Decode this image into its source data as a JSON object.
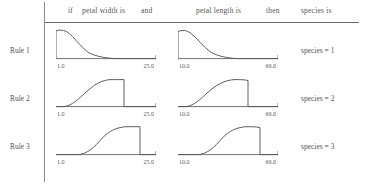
{
  "header": {
    "if_label": "if",
    "antecedent1_label": "petal width is",
    "and_label": "and",
    "antecedent2_label": "petal length is",
    "then_label": "then",
    "consequent_label": "species is"
  },
  "axes": {
    "petal_width": {
      "min_label": "1.0",
      "max_label": "25.0"
    },
    "petal_length": {
      "min_label": "10.0",
      "max_label": "69.0"
    }
  },
  "colors": {
    "curve": "#555555",
    "axis": "#6b6b6b",
    "text": "#555555",
    "background": "#ffffff"
  },
  "rules": [
    {
      "name": "Rule 1",
      "consequent": "species = 1",
      "petal_width_curve": "M 0,3 L 0,34 M 0,3 C 4,2 8,2 12,5 C 18,10 24,20 32,27 C 40,32 52,34 62,34 L 100,34",
      "petal_length_curve": "M 0,4 L 0,34 M 0,4 C 4,2 8,2 13,6 C 19,11 25,21 33,27 C 41,32 52,34 62,34 L 100,34"
    },
    {
      "name": "Rule 2",
      "consequent": "species = 2",
      "petal_width_curve": "M 0,34 L 8,34 C 16,33 22,26 30,18 C 38,10 44,5 54,4 C 60,4 64,4 68,4 L 68,34 L 100,34",
      "petal_length_curve": "M 0,34 L 8,34 C 16,33 22,26 30,18 C 38,10 46,5 56,4 C 62,4 66,4 70,5 L 70,34 L 100,34"
    },
    {
      "name": "Rule 3",
      "consequent": "species = 3",
      "petal_width_curve": "M 0,34 L 22,34 C 32,33 38,26 46,16 C 54,7 60,4 70,3 C 76,3 80,3 84,3 L 84,34 L 100,34",
      "petal_length_curve": "M 0,34 L 20,34 C 30,33 36,26 44,16 C 52,7 58,4 68,3 C 74,3 78,3 82,4 L 82,34 L 100,34"
    }
  ],
  "chart_data": {
    "type": "line",
    "title": "",
    "xlabel": "",
    "ylabel": "",
    "variables": [
      {
        "name": "petal width",
        "range": [
          1.0,
          25.0
        ]
      },
      {
        "name": "petal length",
        "range": [
          10.0,
          69.0
        ]
      }
    ],
    "series": [
      {
        "name": "Rule 1 / petal width",
        "shape": "z-shaped decreasing",
        "x": [
          1.0,
          2.0,
          4.0,
          7.0,
          10.0,
          13.0,
          16.0,
          19.0,
          25.0
        ],
        "values": [
          0.91,
          1.0,
          0.94,
          0.72,
          0.42,
          0.18,
          0.05,
          0.01,
          0.0
        ]
      },
      {
        "name": "Rule 1 / petal length",
        "shape": "z-shaped decreasing",
        "x": [
          10.0,
          14.0,
          20.0,
          27.0,
          34.0,
          41.0,
          48.0,
          56.0,
          69.0
        ],
        "values": [
          0.88,
          1.0,
          0.93,
          0.7,
          0.41,
          0.17,
          0.05,
          0.01,
          0.0
        ]
      },
      {
        "name": "Rule 2 / petal width",
        "shape": "bell / plateau with sharp right cut",
        "x": [
          1.0,
          3.0,
          6.0,
          9.0,
          12.0,
          14.5,
          17.0,
          17.5,
          25.0
        ],
        "values": [
          0.0,
          0.05,
          0.28,
          0.6,
          0.88,
          1.0,
          1.0,
          0.0,
          0.0
        ]
      },
      {
        "name": "Rule 2 / petal length",
        "shape": "bell / plateau with sharp right cut",
        "x": [
          10.0,
          16.0,
          24.0,
          32.0,
          40.0,
          45.0,
          51.0,
          52.0,
          69.0
        ],
        "values": [
          0.0,
          0.05,
          0.28,
          0.6,
          0.88,
          1.0,
          1.0,
          0.0,
          0.0
        ]
      },
      {
        "name": "Rule 3 / petal width",
        "shape": "s-shaped increasing with sharp right cut",
        "x": [
          1.0,
          6.0,
          9.0,
          12.0,
          15.0,
          18.0,
          21.0,
          21.5,
          25.0
        ],
        "values": [
          0.0,
          0.0,
          0.06,
          0.33,
          0.72,
          0.95,
          1.0,
          0.0,
          0.0
        ]
      },
      {
        "name": "Rule 3 / petal length",
        "shape": "s-shaped increasing with sharp right cut",
        "x": [
          10.0,
          22.0,
          28.0,
          34.0,
          41.0,
          48.0,
          55.0,
          56.0,
          69.0
        ],
        "values": [
          0.0,
          0.0,
          0.06,
          0.33,
          0.72,
          0.95,
          1.0,
          0.0,
          0.0
        ]
      }
    ],
    "ylim": [
      0,
      1
    ],
    "grid": false,
    "legend": "none"
  }
}
